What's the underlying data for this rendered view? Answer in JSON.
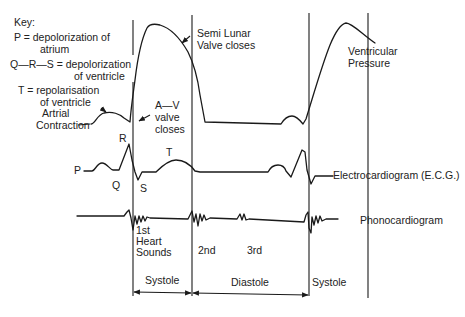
{
  "key": {
    "title": "Key:",
    "p_line1": "P  =  depolorization of",
    "p_line2": "atrium",
    "qrs_line1": "Q—R—S  =  depolorization",
    "qrs_line2": "of ventricle",
    "t_line1": "T  =  repolarisation",
    "t_line2": "of ventricle"
  },
  "annotations": {
    "atrial_contraction_1": "Artrial",
    "atrial_contraction_2": "Contraction",
    "av_valve_1": "A—V",
    "av_valve_2": "valve",
    "av_valve_3": "closes",
    "semilunar_1": "Semi Lunar",
    "semilunar_2": "Valve closes",
    "ventricular_pressure_1": "Ventricular",
    "ventricular_pressure_2": "Pressure"
  },
  "ecg_labels": {
    "p": "P",
    "q": "Q",
    "r": "R",
    "s": "S",
    "t": "T",
    "trace_name": "Electrocardiogram (E.C.G.)"
  },
  "phono_labels": {
    "first_1": "1st",
    "first_2": "Heart",
    "first_3": "Sounds",
    "second": "2nd",
    "third": "3rd",
    "trace_name": "Phonocardiogram"
  },
  "phases": {
    "systole_1": "Systole",
    "diastole": "Diastole",
    "systole_2": "Systole"
  },
  "colors": {
    "line": "#1a1a1a",
    "text": "#222222",
    "background": "#ffffff"
  }
}
